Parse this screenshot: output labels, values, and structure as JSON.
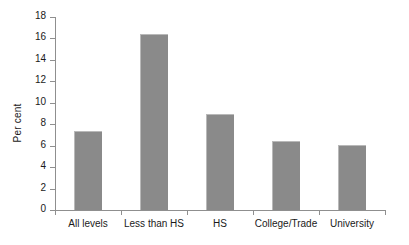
{
  "chart_data": {
    "type": "bar",
    "title": "",
    "xlabel": "",
    "ylabel": "Per cent",
    "categories": [
      "All levels",
      "Less than HS",
      "HS",
      "College/Trade",
      "University"
    ],
    "values": [
      7.4,
      16.4,
      9.0,
      6.4,
      6.1
    ],
    "ylim": [
      0,
      18
    ],
    "yticks": [
      0,
      2,
      4,
      6,
      8,
      10,
      12,
      14,
      16,
      18
    ],
    "ytick_labels": [
      "0",
      "2",
      "4",
      "6",
      "8",
      "10",
      "12",
      "14",
      "16",
      "18"
    ],
    "grid": false,
    "legend": false,
    "bar_color": "#8a8a8a",
    "axis_color": "#8f8f8f",
    "background": "#ffffff"
  }
}
